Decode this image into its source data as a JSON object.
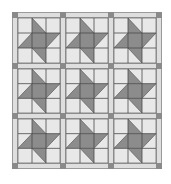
{
  "quilt": {
    "rows": 3,
    "cols": 3,
    "block_type": "pinwheel-star",
    "block_grid": 3,
    "colors": {
      "background": "#ffffff",
      "sashing": "#dedede",
      "light": "#e8e8e8",
      "dark": "#8c8c8c",
      "cornerstone": "#8a8a8a",
      "line": "#4a4a4a",
      "sashing_line": "#9a9a9a"
    },
    "col_edges": [
      0,
      5,
      48,
      53,
      96,
      101,
      144,
      149
    ],
    "row_edges": [
      0,
      5,
      51,
      56,
      101,
      106,
      151,
      156
    ]
  }
}
